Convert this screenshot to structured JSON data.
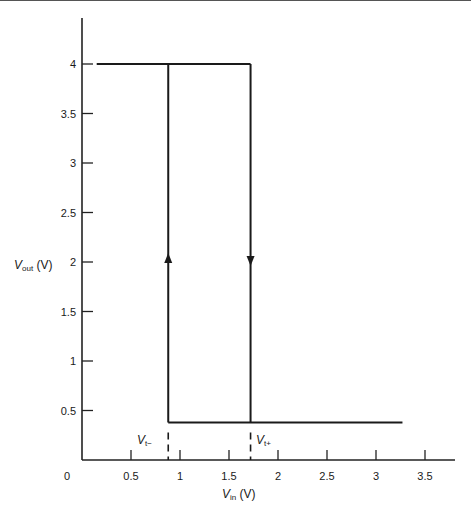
{
  "chart_data": {
    "type": "line",
    "title": "",
    "xlabel": "V_in (V)",
    "ylabel": "V_out (V)",
    "xlim": [
      0,
      3.7
    ],
    "ylim": [
      0,
      4.3
    ],
    "x_ticks": [
      "0",
      "0.5",
      "1",
      "1.5",
      "2",
      "2.5",
      "3",
      "3.5"
    ],
    "y_ticks": [
      "0.5",
      "1",
      "1.5",
      "2",
      "2.5",
      "3",
      "3.5",
      "4"
    ],
    "grid": false,
    "legend": null,
    "series": [
      {
        "name": "high output",
        "x": [
          0.15,
          1.72
        ],
        "y": [
          4.0,
          4.0
        ]
      },
      {
        "name": "low output",
        "x": [
          0.88,
          3.27
        ],
        "y": [
          0.38,
          0.38
        ]
      },
      {
        "name": "rising transition (up arrow)",
        "x": [
          0.88,
          0.88
        ],
        "y": [
          0.38,
          4.0
        ]
      },
      {
        "name": "falling transition (down arrow)",
        "x": [
          1.72,
          1.72
        ],
        "y": [
          4.0,
          0.38
        ]
      }
    ],
    "annotations": [
      {
        "text": "V_t-",
        "x": 0.88,
        "note": "lower threshold, dashed marker"
      },
      {
        "text": "V_t+",
        "x": 1.72,
        "note": "upper threshold, dashed marker"
      }
    ]
  },
  "labels": {
    "x_axis_main": "V",
    "x_axis_sub": "in",
    "x_axis_unit": " (V)",
    "y_axis_main": "V",
    "y_axis_sub": "out",
    "y_axis_unit": " (V)",
    "vt_minus_main": "V",
    "vt_minus_sub": "t−",
    "vt_plus_main": "V",
    "vt_plus_sub": "t+",
    "origin": "0"
  }
}
